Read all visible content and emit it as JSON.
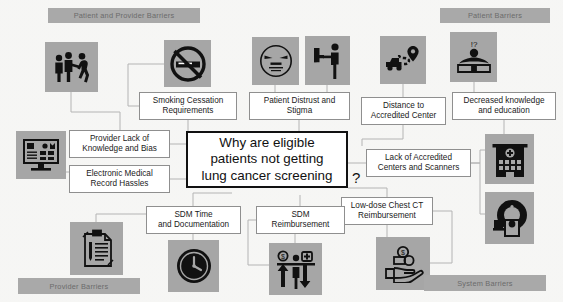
{
  "diagram": {
    "center": {
      "text": "Why are eligible\npatients not getting\nlung cancer screening",
      "trailing_mark": "?"
    },
    "banners": [
      {
        "id": "patient-and-provider-barriers",
        "label": "Patient and Provider Barriers",
        "x": 48,
        "y": 8,
        "w": 152,
        "h": 15
      },
      {
        "id": "patient-barriers",
        "label": "Patient Barriers",
        "x": 440,
        "y": 8,
        "w": 110,
        "h": 15
      },
      {
        "id": "provider-barriers",
        "label": "Provider Barriers",
        "x": 18,
        "y": 278,
        "w": 122,
        "h": 16
      },
      {
        "id": "system-barriers",
        "label": "System Barriers",
        "x": 424,
        "y": 275,
        "w": 122,
        "h": 16
      }
    ],
    "nodes": [
      {
        "id": "smoking-cessation-requirements",
        "label": "Smoking Cessation\nRequirements",
        "x": 139,
        "y": 92,
        "w": 98,
        "h": 28
      },
      {
        "id": "patient-distrust-and-stigma",
        "label": "Patient Distrust and\nStigma",
        "x": 249,
        "y": 92,
        "w": 101,
        "h": 28
      },
      {
        "id": "distance-to-accredited-center",
        "label": "Distance to\nAccredited Center",
        "x": 361,
        "y": 97,
        "w": 85,
        "h": 28
      },
      {
        "id": "decreased-knowledge-and-education",
        "label": "Decreased knowledge\nand education",
        "x": 452,
        "y": 92,
        "w": 104,
        "h": 28
      },
      {
        "id": "provider-lack-of-knowledge-and-bias",
        "label": "Provider Lack of\nKnowledge and Bias",
        "x": 69,
        "y": 130,
        "w": 101,
        "h": 28
      },
      {
        "id": "electronic-medical-record-hassles",
        "label": "Electronic Medical\nRecord Hassles",
        "x": 69,
        "y": 165,
        "w": 101,
        "h": 28
      },
      {
        "id": "lack-of-accredited-centers-and-scanners",
        "label": "Lack of Accredited\nCenters and Scanners",
        "x": 366,
        "y": 149,
        "w": 105,
        "h": 28
      },
      {
        "id": "low-dose-chest-ct-reimbursement",
        "label": "Low-dose Chest CT\nReimbursement",
        "x": 341,
        "y": 197,
        "w": 92,
        "h": 28
      },
      {
        "id": "sdm-time-and-documentation",
        "label": "SDM  Time\nand Documentation",
        "x": 146,
        "y": 206,
        "w": 95,
        "h": 28
      },
      {
        "id": "sdm-reimbursement",
        "label": "SDM\nReimbursement",
        "x": 256,
        "y": 206,
        "w": 89,
        "h": 28
      }
    ],
    "icons": [
      {
        "id": "secondhand-smoke-people-icon",
        "glyph": "people-smoking-icon",
        "x": 45,
        "y": 42,
        "w": 53,
        "h": 50
      },
      {
        "id": "no-smoking-icon",
        "glyph": "no-smoking-icon",
        "x": 164,
        "y": 40,
        "w": 47,
        "h": 47
      },
      {
        "id": "distrust-face-icon",
        "glyph": "skeptical-face-icon",
        "x": 252,
        "y": 37,
        "w": 47,
        "h": 48
      },
      {
        "id": "stigma-pointing-icon",
        "glyph": "person-pointing-icon",
        "x": 305,
        "y": 36,
        "w": 45,
        "h": 49
      },
      {
        "id": "travel-distance-icon",
        "glyph": "car-route-pin-icon",
        "x": 380,
        "y": 36,
        "w": 46,
        "h": 48
      },
      {
        "id": "knowledge-education-icon",
        "glyph": "person-book-question-icon",
        "x": 450,
        "y": 32,
        "w": 47,
        "h": 50
      },
      {
        "id": "computer-emr-icon",
        "glyph": "desktop-monitor-icon",
        "x": 16,
        "y": 131,
        "w": 50,
        "h": 48
      },
      {
        "id": "hospital-building-icon",
        "glyph": "hospital-building-icon",
        "x": 485,
        "y": 134,
        "w": 49,
        "h": 50
      },
      {
        "id": "ct-scanner-icon",
        "glyph": "ct-scanner-icon",
        "x": 485,
        "y": 192,
        "w": 49,
        "h": 52
      },
      {
        "id": "clipboard-documentation-icon",
        "glyph": "clipboard-pen-icon",
        "x": 70,
        "y": 222,
        "w": 53,
        "h": 53
      },
      {
        "id": "clock-time-icon",
        "glyph": "clock-icon",
        "x": 168,
        "y": 240,
        "w": 51,
        "h": 52
      },
      {
        "id": "cost-balance-icon",
        "glyph": "cost-scale-person-icon",
        "x": 269,
        "y": 243,
        "w": 53,
        "h": 52
      },
      {
        "id": "money-hand-icon",
        "glyph": "hand-holding-coins-icon",
        "x": 376,
        "y": 237,
        "w": 54,
        "h": 53
      }
    ],
    "colors": {
      "tile_fill": "#a6a6a6",
      "banner_fill": "#a9a9a9",
      "banner_text": "#6b6b6b",
      "node_border": "#8f8f8f",
      "center_border": "#111111",
      "connector": "#b4b4b4",
      "page_background": "#fdfdfc"
    }
  }
}
